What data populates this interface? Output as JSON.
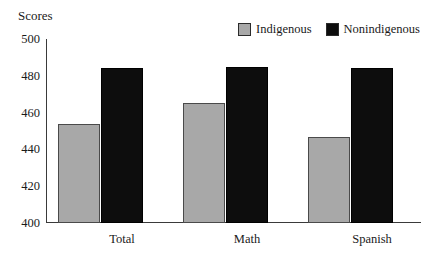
{
  "chart_data": {
    "type": "bar",
    "title": "",
    "xlabel": "",
    "ylabel": "Scores",
    "ylim": [
      400,
      500
    ],
    "yticks": [
      400,
      420,
      440,
      460,
      480,
      500
    ],
    "grid": false,
    "legend_position": "top-right",
    "categories": [
      "Total",
      "Math",
      "Spanish"
    ],
    "series": [
      {
        "name": "Indigenous",
        "color": "#a8a8a8",
        "values": [
          454,
          465,
          447
        ]
      },
      {
        "name": "Nonindigenous",
        "color": "#0d0d0d",
        "values": [
          484,
          485,
          484
        ]
      }
    ]
  },
  "axis": {
    "y_title": "Scores",
    "y_tick_labels": [
      "500",
      "480",
      "460",
      "440",
      "420",
      "400"
    ],
    "x_tick_labels": [
      "Total",
      "Math",
      "Spanish"
    ]
  },
  "legend": {
    "entries": [
      {
        "label": "Indigenous",
        "swatch": "gray-swatch-icon"
      },
      {
        "label": "Nonindigenous",
        "swatch": "black-swatch-icon"
      }
    ]
  }
}
